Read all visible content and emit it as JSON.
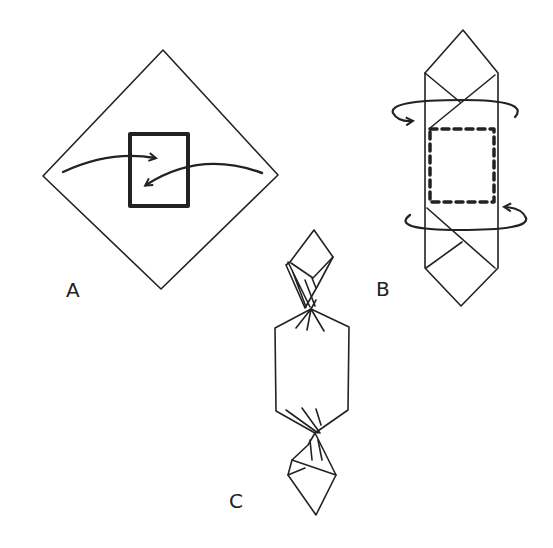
{
  "diagram": {
    "stroke_color": "#222222",
    "background": "#ffffff",
    "panels": [
      {
        "id": "A",
        "label": "A",
        "description": "Square cloth laid as diamond with box in center; left and right corners fold over the box (arrows)."
      },
      {
        "id": "B",
        "label": "B",
        "description": "Cloth folded around box (dashed outline); ends twisted around in opposite directions (circular arrows)."
      },
      {
        "id": "C",
        "label": "C",
        "description": "Finished wrap: both ends twisted like a candy wrapper."
      }
    ]
  }
}
